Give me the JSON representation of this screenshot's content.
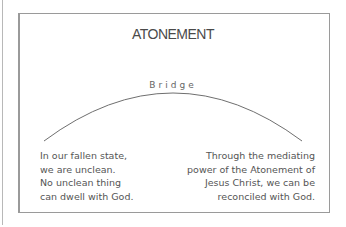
{
  "diagram": {
    "title": "ATONEMENT",
    "bridge_label": "Bridge",
    "left_text": [
      "In our fallen state,",
      "we are unclean.",
      "No unclean thing",
      "can dwell with God."
    ],
    "right_text": [
      "Through the mediating",
      "power of the Atonement of",
      "Jesus Christ, we can be",
      "reconciled with God."
    ],
    "colors": {
      "line": "#777777",
      "text": "#555555",
      "frame": "#9a9a9a"
    }
  }
}
